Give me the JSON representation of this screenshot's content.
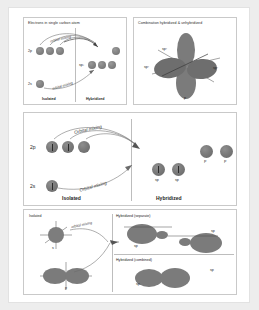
{
  "figure": {
    "background_color": "#ededed",
    "card_color": "#ffffff",
    "orbital_color": "#7b7b7b"
  },
  "section1": {
    "left_panel": {
      "header": "Electrons in single carbon atom",
      "rows": [
        {
          "label": "2p",
          "orbitals": 3
        },
        {
          "label": "2s",
          "orbitals": 1
        }
      ],
      "hybrid_label": "sp³",
      "mixing_label_top": "orbital mixing",
      "mixing_label_bottom": "orbital mixing",
      "footer_left": "Isolated",
      "footer_right": "Hybridized"
    },
    "right_panel": {
      "header": "Combination hybridized & unhybridized",
      "lobe_labels": [
        "sp²",
        "sp²",
        "sp²",
        "p"
      ]
    }
  },
  "section2": {
    "rows": [
      {
        "label": "2p",
        "orbitals": 3,
        "electrons": 2
      },
      {
        "label": "2s",
        "orbitals": 1,
        "electrons": 1
      }
    ],
    "mixing_label_top": "Orbital mixing",
    "mixing_label_bottom": "Orbital mixing",
    "hybrid_orbitals": [
      {
        "label": "sp",
        "electrons": 1
      },
      {
        "label": "sp",
        "electrons": 1
      }
    ],
    "unhybridized": [
      {
        "label": "P"
      },
      {
        "label": "P"
      }
    ],
    "footer_left": "Isolated",
    "footer_right": "Hybridized"
  },
  "section3": {
    "left": {
      "header": "Isolated",
      "s_label": "s",
      "p_label": "p",
      "mixing_label": "orbital mixing"
    },
    "right_top": {
      "header": "Hybridized (separate)",
      "labels": [
        "sp",
        "sp"
      ]
    },
    "right_bottom": {
      "header": "Hybridized (combined)",
      "labels": [
        "sp",
        "sp"
      ]
    }
  }
}
